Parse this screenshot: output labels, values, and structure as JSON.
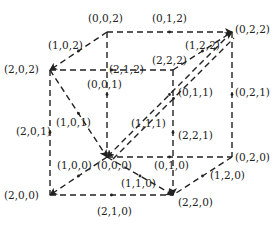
{
  "diagram": {
    "vertices": [
      {
        "id": "v002",
        "label": "(0,0,2)",
        "x": 107,
        "y": 32,
        "lx": 88,
        "ly": 13
      },
      {
        "id": "v022",
        "label": "(0,2,2)",
        "x": 232,
        "y": 32,
        "lx": 235,
        "ly": 24
      },
      {
        "id": "v202",
        "label": "(2,0,2)",
        "x": 50,
        "y": 70,
        "lx": 4,
        "ly": 64
      },
      {
        "id": "v222",
        "label": "(2,2,2)",
        "x": 173,
        "y": 70,
        "lx": 152,
        "ly": 55
      },
      {
        "id": "v000",
        "label": "(0,0,0)",
        "x": 107,
        "y": 157,
        "lx": 97,
        "ly": 160
      },
      {
        "id": "v020",
        "label": "(0,2,0)",
        "x": 232,
        "y": 157,
        "lx": 235,
        "ly": 152
      },
      {
        "id": "v200",
        "label": "(2,0,0)",
        "x": 50,
        "y": 195,
        "lx": 4,
        "ly": 190
      },
      {
        "id": "v220",
        "label": "(2,2,0)",
        "x": 173,
        "y": 195,
        "lx": 178,
        "ly": 197
      }
    ],
    "edge_labels": [
      {
        "label": "(0,1,2)",
        "lx": 152,
        "ly": 13
      },
      {
        "label": "(1,0,2)",
        "lx": 48,
        "ly": 40
      },
      {
        "label": "(1,2,2)",
        "lx": 185,
        "ly": 40
      },
      {
        "label": "(2,1,2)",
        "lx": 109,
        "ly": 64
      },
      {
        "label": "(0,0,1)",
        "lx": 87,
        "ly": 79
      },
      {
        "label": "(0,1,1)",
        "lx": 178,
        "ly": 87
      },
      {
        "label": "(0,2,1)",
        "lx": 235,
        "ly": 87
      },
      {
        "label": "(1,0,1)",
        "lx": 56,
        "ly": 117
      },
      {
        "label": "(1,1,1)",
        "lx": 131,
        "ly": 118
      },
      {
        "label": "(2,0,1)",
        "lx": 16,
        "ly": 126
      },
      {
        "label": "(2,2,1)",
        "lx": 178,
        "ly": 130
      },
      {
        "label": "(1,0,0)",
        "lx": 57,
        "ly": 160
      },
      {
        "label": "(0,1,0)",
        "lx": 154,
        "ly": 160
      },
      {
        "label": "(1,2,0)",
        "lx": 210,
        "ly": 170
      },
      {
        "label": "(1,1,0)",
        "lx": 121,
        "ly": 178
      },
      {
        "label": "(2,1,0)",
        "lx": 97,
        "ly": 206
      }
    ],
    "edges": [
      {
        "from": [
          107,
          32
        ],
        "to": [
          232,
          32
        ],
        "arrow": "end"
      },
      {
        "from": [
          107,
          32
        ],
        "to": [
          50,
          70
        ],
        "arrow": "end"
      },
      {
        "from": [
          50,
          70
        ],
        "to": [
          173,
          70
        ],
        "arrow": "none"
      },
      {
        "from": [
          107,
          32
        ],
        "to": [
          107,
          157
        ],
        "arrow": "none"
      },
      {
        "from": [
          232,
          32
        ],
        "to": [
          232,
          157
        ],
        "arrow": "none"
      },
      {
        "from": [
          50,
          70
        ],
        "to": [
          50,
          195
        ],
        "arrow": "none"
      },
      {
        "from": [
          173,
          70
        ],
        "to": [
          173,
          195
        ],
        "arrow": "end"
      },
      {
        "from": [
          107,
          157
        ],
        "to": [
          232,
          157
        ],
        "arrow": "none"
      },
      {
        "from": [
          107,
          157
        ],
        "to": [
          50,
          195
        ],
        "arrow": "end"
      },
      {
        "from": [
          50,
          195
        ],
        "to": [
          173,
          195
        ],
        "arrow": "none"
      },
      {
        "from": [
          232,
          157
        ],
        "to": [
          173,
          195
        ],
        "arrow": "none"
      },
      {
        "from": [
          50,
          70
        ],
        "to": [
          107,
          157
        ],
        "arrow": "end"
      },
      {
        "from": [
          232,
          32
        ],
        "to": [
          107,
          157
        ],
        "arrow": "end"
      },
      {
        "from": [
          173,
          70
        ],
        "to": [
          232,
          32
        ],
        "arrow": "end"
      },
      {
        "from": [
          107,
          157
        ],
        "to": [
          232,
          32
        ],
        "arrow": "none"
      },
      {
        "from": [
          107,
          157
        ],
        "to": [
          173,
          195
        ],
        "arrow": "end"
      }
    ]
  }
}
